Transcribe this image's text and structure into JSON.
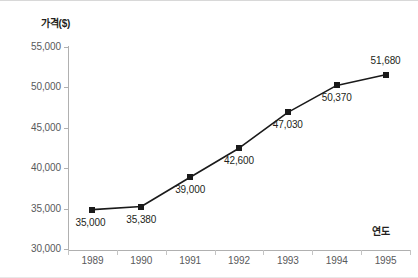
{
  "chart_data": {
    "type": "line",
    "title": "",
    "xlabel": "연도",
    "ylabel": "가격($)",
    "categories": [
      "1989",
      "1990",
      "1991",
      "1992",
      "1993",
      "1994",
      "1995"
    ],
    "values": [
      35000,
      35380,
      39000,
      42600,
      47030,
      50370,
      51680
    ],
    "point_labels": [
      "35,000",
      "35,380",
      "39,000",
      "42,600",
      "47,030",
      "50,370",
      "51,680"
    ],
    "ylim": [
      30000,
      55000
    ],
    "y_ticks": [
      55000,
      50000,
      45000,
      40000,
      35000,
      30000
    ],
    "y_tick_labels": [
      "55,000",
      "50,000",
      "45,000",
      "40,000",
      "35,000",
      "30,000"
    ],
    "grid": false,
    "legend": "none",
    "series": [
      {
        "name": "가격($)",
        "values": [
          35000,
          35380,
          39000,
          42600,
          47030,
          50370,
          51680
        ],
        "line_color": "#1a1a1a",
        "marker_color": "#1a1a1a",
        "marker": "square"
      }
    ],
    "label_positions": [
      "below-left",
      "below",
      "below",
      "below",
      "below",
      "below",
      "above"
    ],
    "colors": {
      "axis": "#b0b0b0",
      "tick_text": "#58595b",
      "data_text": "#231f20",
      "series": "#1a1a1a",
      "background": "#ffffff"
    }
  }
}
